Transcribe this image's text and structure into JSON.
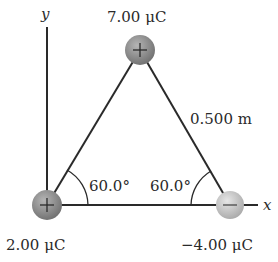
{
  "figure": {
    "axes": {
      "x_label": "x",
      "y_label": "y"
    },
    "charges": [
      {
        "id": "top",
        "label": "7.00 μC",
        "sign": "+",
        "symbol": "+"
      },
      {
        "id": "left",
        "label": "2.00 μC",
        "sign": "+",
        "symbol": "+"
      },
      {
        "id": "right",
        "label": "−4.00 μC",
        "sign": "-",
        "symbol": "−"
      }
    ],
    "side_length": "0.500 m",
    "angles": {
      "left": "60.0°",
      "right": "60.0°"
    },
    "colors": {
      "positive": "#8a8a8a",
      "negative": "#c8c8c8",
      "line": "#2a2a2a"
    }
  }
}
